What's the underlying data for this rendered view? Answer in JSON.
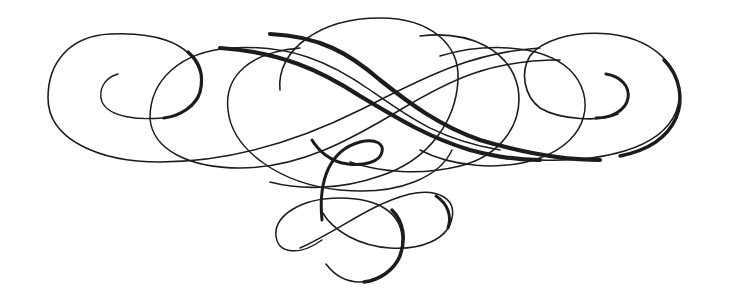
{
  "image": {
    "kind": "calligraphic-flourish-ornament",
    "width": 729,
    "height": 306,
    "background": "#ffffff",
    "ink_color": "#1c1c1c"
  },
  "ornament": {
    "strokes": [
      {
        "name": "left-outer-spiral",
        "width": 1.6,
        "d": "M 200 72 C 190 40 150 32 110 34 C 70 36 48 62 48 98 C 48 140 100 162 160 162 C 230 162 300 140 360 110 C 420 80 470 52 540 48"
      },
      {
        "name": "left-inner-curl",
        "width": 1.4,
        "d": "M 118 74 C 104 78 98 90 102 102 C 110 118 140 120 162 118 C 186 116 202 100 202 82 C 202 72 198 62 190 54"
      },
      {
        "name": "left-spiral-thick-back",
        "width": 3.2,
        "d": "M 188 52 C 200 62 204 76 200 92 C 196 106 180 116 164 118"
      },
      {
        "name": "left-second-loop",
        "width": 1.5,
        "d": "M 150 118 C 150 80 180 52 230 48 C 290 44 330 62 370 90 C 410 118 440 140 500 150"
      },
      {
        "name": "left-second-loop-lower",
        "width": 1.5,
        "d": "M 150 118 C 152 150 190 168 240 168 C 300 168 350 140 400 110 C 450 80 490 60 560 60"
      },
      {
        "name": "center-big-left-oval",
        "width": 1.5,
        "d": "M 300 48 C 250 52 224 76 228 110 C 232 150 280 184 340 190 C 400 196 440 176 452 150"
      },
      {
        "name": "center-big-oval",
        "width": 1.6,
        "d": "M 280 90 C 276 50 320 18 380 18 C 430 18 460 44 458 80 C 456 120 430 160 380 176 C 340 190 300 190 270 182"
      },
      {
        "name": "center-thick-s-1",
        "width": 4.2,
        "d": "M 220 48 C 280 52 320 70 360 96 C 400 120 430 138 470 150 C 500 158 520 160 540 160"
      },
      {
        "name": "center-thick-s-2",
        "width": 4.2,
        "d": "M 270 34 C 320 36 350 54 380 80 C 410 104 440 126 480 140 C 520 152 560 160 600 160"
      },
      {
        "name": "right-big-oval",
        "width": 1.6,
        "d": "M 420 36 C 470 30 510 50 518 88 C 524 124 500 156 460 166 C 420 176 380 172 350 162"
      },
      {
        "name": "right-second-loop",
        "width": 1.5,
        "d": "M 440 56 C 480 44 540 42 570 70 C 596 96 590 140 540 158 C 500 172 450 166 420 150"
      },
      {
        "name": "right-outer-spiral",
        "width": 1.6,
        "d": "M 540 160 C 600 162 660 150 676 112 C 690 76 660 40 610 34 C 570 30 540 42 530 56 C 520 72 524 96 540 108 C 560 120 600 122 618 114"
      },
      {
        "name": "right-inner-curl",
        "width": 3.0,
        "d": "M 606 74 C 620 76 630 86 628 98 C 626 110 612 118 596 118"
      },
      {
        "name": "right-outer-thick-edge",
        "width": 3.4,
        "d": "M 664 60 C 680 76 684 100 676 118 C 668 136 650 150 620 156"
      },
      {
        "name": "center-small-curl",
        "width": 3.0,
        "d": "M 322 220 C 318 180 330 150 360 142 C 376 138 384 144 382 152 C 380 162 364 166 348 164 C 330 162 318 150 312 140"
      },
      {
        "name": "bottom-left-loop",
        "width": 1.5,
        "d": "M 322 240 C 300 256 278 254 276 236 C 274 216 300 198 340 198 C 380 198 400 214 402 236 C 404 262 384 282 360 282 C 342 282 332 272 326 264"
      },
      {
        "name": "bottom-right-loop",
        "width": 1.5,
        "d": "M 300 248 C 340 230 370 204 410 194 C 440 188 456 200 452 218 C 448 240 420 250 390 248 C 360 246 334 232 322 212"
      },
      {
        "name": "bottom-thick-swell",
        "width": 3.4,
        "d": "M 392 210 C 404 222 406 240 400 256 C 394 270 380 280 364 282"
      },
      {
        "name": "bottom-right-thick-swell",
        "width": 3.0,
        "d": "M 436 196 C 448 204 452 216 448 228"
      }
    ]
  }
}
